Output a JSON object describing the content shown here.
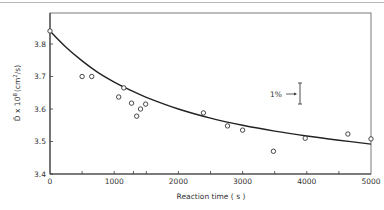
{
  "chart_data": {
    "type": "scatter",
    "title": "",
    "xlabel": "Reaction time (s)",
    "ylabel": "D̄ x 10⁸ (cm²/s)",
    "xlim": [
      0,
      5000
    ],
    "ylim": [
      3.4,
      3.88
    ],
    "xticks": [
      "0",
      "1000",
      "2000",
      "3000",
      "4000",
      "5000"
    ],
    "yticks": [
      "3.4",
      "3.5",
      "3.6",
      "3.7",
      "3.8"
    ],
    "grid": false,
    "legend": null,
    "series": [
      {
        "name": "measured",
        "marker": "open-circle",
        "x": [
          0,
          500,
          650,
          1070,
          1150,
          1270,
          1350,
          1410,
          1490,
          2390,
          2765,
          3000,
          3480,
          3975,
          4640,
          5000
        ],
        "y": [
          3.84,
          3.7,
          3.7,
          3.637,
          3.665,
          3.618,
          3.578,
          3.6,
          3.615,
          3.588,
          3.548,
          3.535,
          3.47,
          3.51,
          3.523,
          3.508
        ]
      },
      {
        "name": "fit",
        "line": "solid",
        "x": [
          0,
          250,
          500,
          750,
          1000,
          1250,
          1500,
          2000,
          2500,
          3000,
          3500,
          4000,
          4500,
          5000
        ],
        "y": [
          3.84,
          3.79,
          3.748,
          3.712,
          3.683,
          3.658,
          3.636,
          3.6,
          3.572,
          3.55,
          3.532,
          3.517,
          3.504,
          3.492
        ]
      }
    ],
    "annotations": [
      {
        "text": "1%",
        "type": "error-bar",
        "x": 3950,
        "y_top": 3.68,
        "y_bottom": 3.615
      }
    ]
  },
  "axes": {
    "xlabel": "Reaction time ( s )",
    "ylabel_main": "D̄ x 10",
    "ylabel_exp": "8",
    "ylabel_unit": "(cm",
    "ylabel_unit_exp": "2",
    "ylabel_unit_end": "/s)",
    "annotation_label": "1%"
  }
}
